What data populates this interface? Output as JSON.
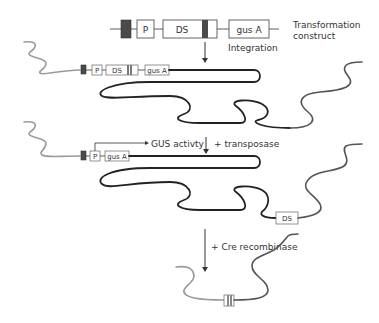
{
  "diagram": {
    "construct": {
      "label_line1": "Transformation",
      "label_line2": "construct",
      "elements": [
        "P",
        "DS",
        "gus A"
      ],
      "step_label": "Integration"
    },
    "stage1": {
      "elements": [
        "P",
        "DS",
        "gus A"
      ]
    },
    "stage2": {
      "elements": [
        "P",
        "gus A"
      ],
      "reporter_label": "GUS activty",
      "step_label": "+ transposase",
      "excised_element": "DS"
    },
    "stage3": {
      "step_label": "+ Cre recombinase"
    },
    "colors": {
      "chromosome": "#222222",
      "flank_left": "#999999",
      "flank_right": "#555555",
      "marker_dark": "#4a4a4a",
      "box_stroke": "#555555"
    }
  }
}
